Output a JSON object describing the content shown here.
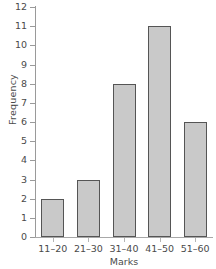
{
  "chart_data": {
    "type": "bar",
    "title": "",
    "xlabel": "Marks",
    "ylabel": "Frequency",
    "categories": [
      "11–20",
      "21–30",
      "31–40",
      "41–50",
      "51–60"
    ],
    "values": [
      2,
      3,
      8,
      11,
      6
    ],
    "ylim": [
      0,
      12
    ],
    "ytick_labels": [
      "0",
      "1",
      "2",
      "3",
      "4",
      "5",
      "6",
      "7",
      "8",
      "9",
      "10",
      "11",
      "12"
    ],
    "ytick_values": [
      0,
      1,
      2,
      3,
      4,
      5,
      6,
      7,
      8,
      9,
      10,
      11,
      12
    ],
    "grid": false,
    "legend": false,
    "series": [
      {
        "name": "Frequency",
        "values": [
          2,
          3,
          8,
          11,
          6
        ]
      }
    ],
    "colors": {
      "bar_fill": "#c9c9c9",
      "bar_border": "#555555",
      "axis": "#9a9a9a",
      "text": "#4a4a4a",
      "background": "#ffffff"
    }
  }
}
